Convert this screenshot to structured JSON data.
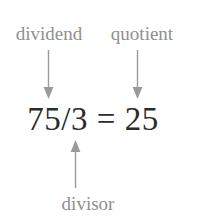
{
  "figure": {
    "background_color": "#ffffff",
    "width": 199,
    "height": 223,
    "label_color": "#8f8f8f",
    "equation_color": "#2b2b2b",
    "arrow_color": "#9a9a9a"
  },
  "labels": {
    "dividend": "dividend",
    "quotient": "quotient",
    "divisor": "divisor"
  },
  "equation": {
    "text": "75/3 = 25",
    "dividend_value": "75",
    "divisor_value": "3",
    "quotient_value": "25",
    "operator": "/",
    "equals": "="
  },
  "arrows": [
    {
      "name": "dividend-arrow",
      "direction": "down",
      "from_label": "dividend",
      "to_term": "75"
    },
    {
      "name": "quotient-arrow",
      "direction": "down",
      "from_label": "quotient",
      "to_term": "25"
    },
    {
      "name": "divisor-arrow",
      "direction": "up",
      "from_label": "divisor",
      "to_term": "3"
    }
  ]
}
